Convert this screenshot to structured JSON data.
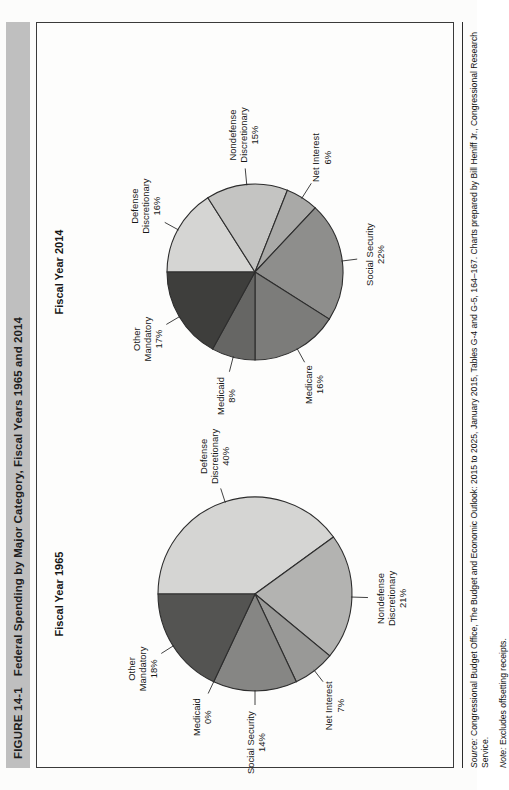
{
  "figure": {
    "number": "FIGURE 14-1",
    "title": "Federal Spending by Major Category, Fiscal Years 1965 and 2014"
  },
  "footnotes": {
    "source_label": "Source:",
    "source_text": " Congressional Budget Office, The Budget and Economic Outlook: 2015 to 2025, January 2015, Tables G-4 and G-5, 164–167. Charts prepared by Bill Heniff Jr., Congressional Research Service.",
    "note_label": "Note:",
    "note_text": " Excludes offsetting receipts."
  },
  "chart_data": [
    {
      "type": "pie",
      "id": "fy1965",
      "title": "Fiscal Year 1965",
      "categories": [
        "Defense Discretionary",
        "Nondefense Discretionary",
        "Net Interest",
        "Social Security",
        "Medicaid",
        "Other Mandatory"
      ],
      "values": [
        40,
        21,
        7,
        14,
        0,
        18
      ],
      "labels": [
        "Defense\nDiscretionary\n40%",
        "Nondefense\nDiscretionary\n21%",
        "Net Interest\n7%",
        "Social Security\n14%",
        "Medicaid\n0%",
        "Other\nMandatory\n18%"
      ],
      "colors": [
        "#d5d5d3",
        "#b3b3b1",
        "#999997",
        "#868684",
        "#6f6f6d",
        "#545452"
      ],
      "legend": "none",
      "unit": "%"
    },
    {
      "type": "pie",
      "id": "fy2014",
      "title": "Fiscal Year 2014",
      "categories": [
        "Defense Discretionary",
        "Nondefense Discretionary",
        "Net Interest",
        "Social Security",
        "Medicare",
        "Medicaid",
        "Other Mandatory"
      ],
      "values": [
        16,
        15,
        6,
        22,
        16,
        8,
        17
      ],
      "labels": [
        "Defense\nDiscretionary\n16%",
        "Nondefense\nDiscretionary\n15%",
        "Net Interest\n6%",
        "Social Security\n22%",
        "Medicare\n16%",
        "Medicaid\n8%",
        "Other\nMandatory\n17%"
      ],
      "colors": [
        "#d5d5d3",
        "#c4c4c2",
        "#a9a9a7",
        "#8e8e8c",
        "#7c7c7a",
        "#666664",
        "#3e3e3c"
      ],
      "legend": "none",
      "unit": "%"
    }
  ]
}
